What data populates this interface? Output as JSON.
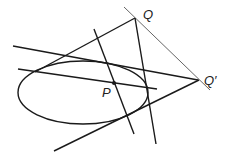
{
  "diagram": {
    "type": "projective-geometry-pole-polar",
    "colors": {
      "stroke": "#1a1a1a",
      "thin_stroke": "#555555",
      "label": "#222222",
      "background": "#ffffff"
    },
    "labels": {
      "Q": "Q",
      "Q_prime": "Q′",
      "P": "P"
    },
    "points": {
      "Q": [
        135,
        18
      ],
      "Q_prime": [
        198,
        80
      ],
      "P": [
        114,
        83
      ]
    },
    "ellipse": {
      "cx": 83,
      "cy": 92.5,
      "rx": 65,
      "ry": 31.5
    }
  }
}
